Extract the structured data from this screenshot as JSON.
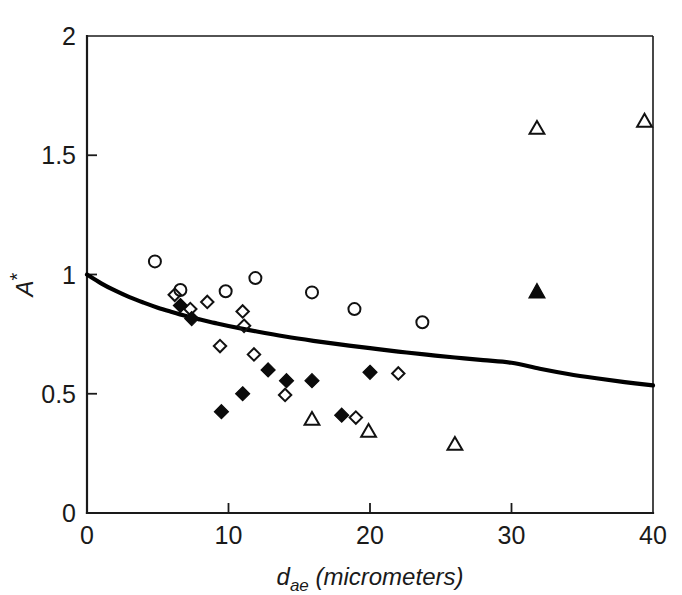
{
  "chart_data": {
    "type": "scatter",
    "title": "",
    "xlabel": "d_ae (micrometers)",
    "xlabel_main": "d",
    "xlabel_sub": "ae",
    "xlabel_rest": " (micrometers)",
    "ylabel": "A*",
    "ylabel_main": "A",
    "ylabel_sup": "*",
    "xlim": [
      0,
      40
    ],
    "ylim": [
      0,
      2
    ],
    "xticks": [
      0,
      10,
      20,
      30,
      40
    ],
    "xticklabels": [
      "0",
      "10",
      "20",
      "30",
      "40"
    ],
    "yticks": [
      0,
      0.5,
      1,
      1.5,
      2
    ],
    "yticklabels": [
      "0",
      "0.5",
      "1",
      "1.5",
      "2"
    ],
    "grid": false,
    "legend": "none",
    "frame": "box",
    "tick_direction": "in",
    "series": [
      {
        "name": "open-circle",
        "marker": "circle-open",
        "points": [
          [
            4.8,
            1.055
          ],
          [
            6.6,
            0.935
          ],
          [
            9.8,
            0.93
          ],
          [
            11.9,
            0.985
          ],
          [
            15.9,
            0.925
          ],
          [
            18.9,
            0.855
          ],
          [
            23.7,
            0.8
          ]
        ]
      },
      {
        "name": "open-diamond",
        "marker": "diamond-open",
        "points": [
          [
            6.2,
            0.915
          ],
          [
            7.3,
            0.855
          ],
          [
            8.5,
            0.885
          ],
          [
            9.4,
            0.7
          ],
          [
            11.0,
            0.845
          ],
          [
            11.1,
            0.785
          ],
          [
            11.8,
            0.665
          ],
          [
            14.0,
            0.495
          ],
          [
            19.0,
            0.4
          ],
          [
            22.0,
            0.585
          ]
        ]
      },
      {
        "name": "filled-diamond",
        "marker": "diamond-filled",
        "points": [
          [
            6.6,
            0.87
          ],
          [
            7.4,
            0.815
          ],
          [
            9.5,
            0.425
          ],
          [
            11.0,
            0.5
          ],
          [
            12.8,
            0.6
          ],
          [
            14.1,
            0.555
          ],
          [
            15.9,
            0.555
          ],
          [
            18.0,
            0.41
          ],
          [
            20.0,
            0.59
          ]
        ]
      },
      {
        "name": "open-triangle",
        "marker": "triangle-open",
        "points": [
          [
            15.9,
            0.395
          ],
          [
            19.9,
            0.345
          ],
          [
            26.0,
            0.29
          ],
          [
            31.8,
            1.615
          ],
          [
            39.4,
            1.645
          ]
        ]
      },
      {
        "name": "filled-triangle",
        "marker": "triangle-filled",
        "points": [
          [
            31.8,
            0.93
          ]
        ]
      }
    ],
    "fit_curve": {
      "name": "model-fit",
      "description": "monotonically decreasing curve from A*=1.0 at d_ae=0 to A*=0.535 at d_ae=40",
      "points": [
        [
          0,
          1.0
        ],
        [
          1,
          0.963
        ],
        [
          2,
          0.932
        ],
        [
          3,
          0.905
        ],
        [
          4,
          0.882
        ],
        [
          5,
          0.861
        ],
        [
          6,
          0.843
        ],
        [
          7,
          0.826
        ],
        [
          8,
          0.811
        ],
        [
          9,
          0.797
        ],
        [
          10,
          0.784
        ],
        [
          12,
          0.761
        ],
        [
          14,
          0.74
        ],
        [
          16,
          0.722
        ],
        [
          18,
          0.706
        ],
        [
          20,
          0.691
        ],
        [
          22,
          0.677
        ],
        [
          24,
          0.664
        ],
        [
          26,
          0.652
        ],
        [
          28,
          0.641
        ],
        [
          30,
          0.63
        ],
        [
          32,
          0.605
        ],
        [
          34,
          0.583
        ],
        [
          36,
          0.565
        ],
        [
          38,
          0.549
        ],
        [
          40,
          0.535
        ]
      ]
    },
    "colors": {
      "axis": "#1a1a1a",
      "curve": "#000000",
      "marker_stroke": "#111111",
      "marker_fill": "#0b0b0b",
      "background": "#ffffff"
    }
  }
}
